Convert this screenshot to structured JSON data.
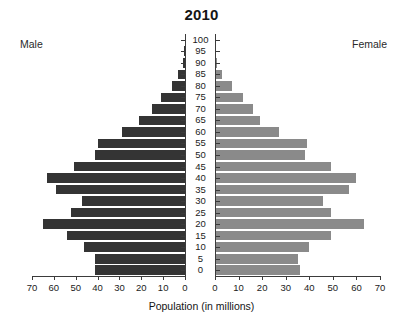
{
  "chart": {
    "title": "2010",
    "left_label": "Male",
    "right_label": "Female",
    "xtitle": "Population (in millions)",
    "colors": {
      "male_bar": "#343434",
      "female_bar": "#8a8a8a",
      "axis": "#3b3b3b",
      "background": "#ffffff"
    }
  },
  "chart_data": {
    "type": "bar",
    "subtype": "population-pyramid",
    "title": "2010",
    "xlabel": "Population (in millions)",
    "ylabel": "",
    "categories": [
      "0",
      "5",
      "10",
      "15",
      "20",
      "25",
      "30",
      "35",
      "40",
      "45",
      "50",
      "55",
      "60",
      "65",
      "70",
      "75",
      "80",
      "85",
      "90",
      "95",
      "100"
    ],
    "axis_tick_labels_left": [
      "70",
      "60",
      "50",
      "40",
      "30",
      "20",
      "10",
      "0"
    ],
    "axis_tick_labels_right": [
      "0",
      "10",
      "20",
      "30",
      "40",
      "50",
      "60",
      "70"
    ],
    "xlim": [
      0,
      70
    ],
    "grid": false,
    "legend": [
      "Male",
      "Female"
    ],
    "legend_position": "outside-top-corners",
    "series": [
      {
        "name": "Male",
        "values": [
          41,
          41,
          46,
          54,
          65,
          52,
          47,
          59,
          63,
          51,
          41,
          40,
          29,
          21,
          15,
          11,
          6,
          3,
          1,
          0.3,
          0
        ]
      },
      {
        "name": "Female",
        "values": [
          36,
          35,
          40,
          49,
          63,
          49,
          46,
          57,
          60,
          49,
          38,
          39,
          27,
          19,
          16,
          12,
          7,
          3,
          1,
          0.3,
          0
        ]
      }
    ],
    "units": "millions"
  },
  "axis": {
    "left_ticks": [
      {
        "label": "70",
        "value": 70
      },
      {
        "label": "60",
        "value": 60
      },
      {
        "label": "50",
        "value": 50
      },
      {
        "label": "40",
        "value": 40
      },
      {
        "label": "30",
        "value": 30
      },
      {
        "label": "20",
        "value": 20
      },
      {
        "label": "10",
        "value": 10
      },
      {
        "label": "0",
        "value": 0
      }
    ],
    "right_ticks": [
      {
        "label": "0",
        "value": 0
      },
      {
        "label": "10",
        "value": 10
      },
      {
        "label": "20",
        "value": 20
      },
      {
        "label": "30",
        "value": 30
      },
      {
        "label": "40",
        "value": 40
      },
      {
        "label": "50",
        "value": 50
      },
      {
        "label": "60",
        "value": 60
      },
      {
        "label": "70",
        "value": 70
      }
    ]
  }
}
